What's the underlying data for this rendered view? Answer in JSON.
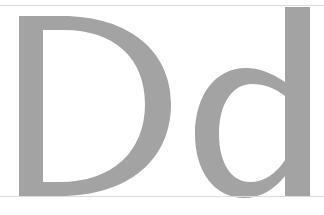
{
  "letters": {
    "upper": "D",
    "lower": "d",
    "text": "Dd"
  },
  "colors": {
    "glyph": "#a3a3a3",
    "rule": "#dcdcdc",
    "background": "#ffffff"
  }
}
